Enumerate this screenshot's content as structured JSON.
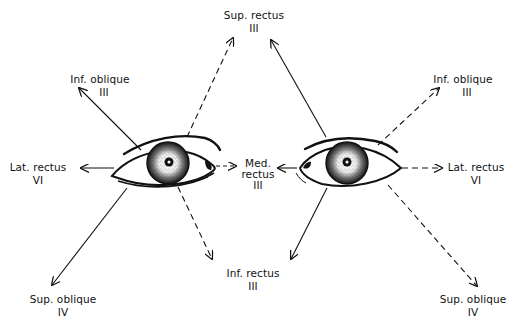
{
  "diagram": {
    "legend": {
      "solid": "right eye muscle action (solid arrow)",
      "dashed": "left eye muscle action (dashed arrow)"
    },
    "colors": {
      "ink": "#111111",
      "background": "#ffffff"
    },
    "labels": {
      "sup_rectus": {
        "name": "Sup. rectus",
        "nerve": "III"
      },
      "inf_oblique_r": {
        "name": "Inf. oblique",
        "nerve": "III"
      },
      "inf_oblique_l": {
        "name": "Inf. oblique",
        "nerve": "III"
      },
      "lat_rectus_r": {
        "name": "Lat. rectus",
        "nerve": "VI"
      },
      "lat_rectus_l": {
        "name": "Lat. rectus",
        "nerve": "VI"
      },
      "med_rectus": {
        "name1": "Med.",
        "name2": "rectus",
        "nerve": "III"
      },
      "inf_rectus": {
        "name": "Inf. rectus",
        "nerve": "III"
      },
      "sup_oblique_r": {
        "name": "Sup. oblique",
        "nerve": "IV"
      },
      "sup_oblique_l": {
        "name": "Sup. oblique",
        "nerve": "IV"
      }
    }
  }
}
